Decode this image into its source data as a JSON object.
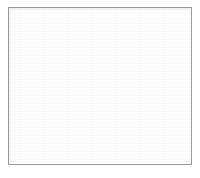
{
  "figure": {
    "caption": "",
    "background_color": "#ffffff",
    "frame": {
      "border_color": "#9a9a9a",
      "border_width_px": 1,
      "fill_color": "#ffffff",
      "margin_px": 8
    }
  },
  "chart_data": {
    "type": "venn",
    "subtitle": "",
    "xlabel": "",
    "ylabel": "",
    "sets": 3,
    "grid": false,
    "legend_position": "none",
    "blend_mode": "screen",
    "canvas": {
      "width": 184,
      "height": 158
    },
    "circles": [
      {
        "id": "top",
        "label": "",
        "cx": 92,
        "cy": 61,
        "r": 46,
        "fill": "#7d7d7d",
        "tone": "medium-gray"
      },
      {
        "id": "left",
        "label": "",
        "cx": 62,
        "cy": 101,
        "r": 46,
        "fill": "#555555",
        "tone": "dark-gray"
      },
      {
        "id": "right",
        "label": "",
        "cx": 122,
        "cy": 101,
        "r": 46,
        "fill": "#1a1a1a",
        "tone": "near-black"
      }
    ],
    "regions": [
      {
        "id": "top-only",
        "members": [
          "top"
        ],
        "fill": "#7d7d7d",
        "label": ""
      },
      {
        "id": "left-only",
        "members": [
          "left"
        ],
        "fill": "#555555",
        "label": ""
      },
      {
        "id": "right-only",
        "members": [
          "right"
        ],
        "fill": "#1a1a1a",
        "label": ""
      },
      {
        "id": "top-left",
        "members": [
          "top",
          "left"
        ],
        "fill": "#d9d9d6",
        "label": ""
      },
      {
        "id": "top-right",
        "members": [
          "top",
          "right"
        ],
        "fill": "#8d8d8d",
        "label": ""
      },
      {
        "id": "left-right",
        "members": [
          "left",
          "right"
        ],
        "fill": "#8a8a8a",
        "label": ""
      },
      {
        "id": "all-three",
        "members": [
          "top",
          "left",
          "right"
        ],
        "fill": "#fafafa",
        "label": ""
      }
    ]
  }
}
